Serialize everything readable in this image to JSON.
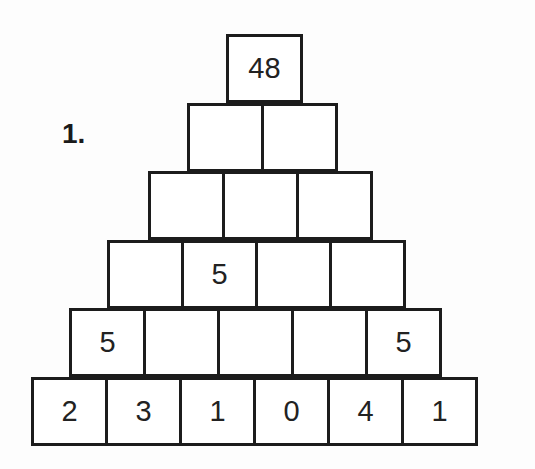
{
  "problem": {
    "number_label": "1."
  },
  "pyramid": {
    "rows": [
      {
        "left": 226,
        "top": 34,
        "cells": [
          "48"
        ]
      },
      {
        "left": 187,
        "top": 103,
        "cells": [
          "",
          ""
        ]
      },
      {
        "left": 148,
        "top": 171,
        "cells": [
          "",
          "",
          ""
        ]
      },
      {
        "left": 107,
        "top": 240,
        "cells": [
          "",
          "5",
          "",
          ""
        ]
      },
      {
        "left": 69,
        "top": 308,
        "cells": [
          "5",
          "",
          "",
          "",
          "5"
        ]
      },
      {
        "left": 31,
        "top": 377,
        "cells": [
          "2",
          "3",
          "1",
          "0",
          "4",
          "1"
        ]
      }
    ]
  },
  "colors": {
    "line": "#1c1c1c",
    "text": "#222222",
    "background": "#fdfdfd"
  }
}
